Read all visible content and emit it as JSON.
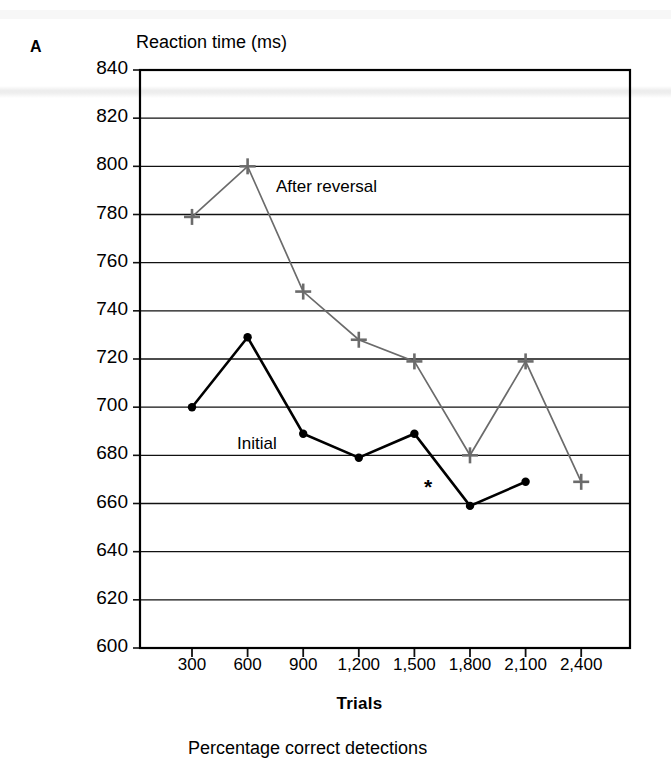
{
  "panel": {
    "letter": "A"
  },
  "chart_data": {
    "type": "line",
    "title": "",
    "ylabel": "Reaction time (ms)",
    "xlabel": "Trials",
    "categories": [
      "300",
      "600",
      "900",
      "1,200",
      "1,500",
      "1,800",
      "2,100",
      "2,400"
    ],
    "x": [
      300,
      600,
      900,
      1200,
      1500,
      1800,
      2100,
      2400
    ],
    "ylim": [
      600,
      840
    ],
    "yticks": [
      840,
      820,
      800,
      780,
      760,
      740,
      720,
      700,
      680,
      660,
      640,
      620,
      600
    ],
    "ytick_labels": [
      "840",
      "820",
      "800",
      "780",
      "760",
      "740",
      "720",
      "700",
      "680",
      "660",
      "640",
      "620",
      "600"
    ],
    "grid": true,
    "legend_position": "inline-annotation",
    "series": [
      {
        "name": "After reversal",
        "color": "#6b6b6b",
        "marker": "plus",
        "x": [
          300,
          600,
          900,
          1200,
          1500,
          1800,
          2100,
          2400
        ],
        "values": [
          779,
          800,
          748,
          728,
          719,
          680,
          719,
          669
        ]
      },
      {
        "name": "Initial",
        "color": "#000000",
        "marker": "circle",
        "x": [
          300,
          600,
          900,
          1200,
          1500,
          1800,
          2100
        ],
        "values": [
          700,
          729,
          689,
          679,
          689,
          659,
          669
        ]
      }
    ],
    "annotations": [
      {
        "text": "*",
        "x": 1650,
        "y": 666
      }
    ]
  },
  "footer": {
    "next_panel_caption": "Percentage correct detections"
  }
}
